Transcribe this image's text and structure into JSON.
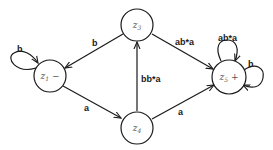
{
  "diagram": {
    "type": "state-transition-graph",
    "nodes": [
      {
        "id": "z1",
        "label": "z",
        "sub": "1",
        "suffix": " −",
        "role": "start"
      },
      {
        "id": "z3",
        "label": "z",
        "sub": "3",
        "suffix": "",
        "role": "intermediate"
      },
      {
        "id": "z4",
        "label": "z",
        "sub": "4",
        "suffix": "",
        "role": "intermediate"
      },
      {
        "id": "z5",
        "label": "z",
        "sub": "5",
        "suffix": " +",
        "role": "final"
      }
    ],
    "edges": [
      {
        "from": "z1",
        "to": "z1",
        "label": "b"
      },
      {
        "from": "z3",
        "to": "z1",
        "label": "b"
      },
      {
        "from": "z1",
        "to": "z4",
        "label": "a"
      },
      {
        "from": "z4",
        "to": "z3",
        "label": "bb*a"
      },
      {
        "from": "z3",
        "to": "z5",
        "label": "ab*a"
      },
      {
        "from": "z4",
        "to": "z5",
        "label": "a"
      },
      {
        "from": "z5",
        "to": "z5",
        "label": "ab*a"
      },
      {
        "from": "z5",
        "to": "z5",
        "label": "b"
      }
    ]
  }
}
